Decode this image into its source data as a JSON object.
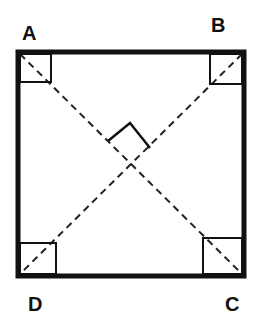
{
  "diagram": {
    "vertices": {
      "A": {
        "label": "A",
        "position": "top-left"
      },
      "B": {
        "label": "B",
        "position": "top-right"
      },
      "C": {
        "label": "C",
        "position": "bottom-right"
      },
      "D": {
        "label": "D",
        "position": "bottom-left"
      }
    },
    "diagonals": [
      "AC",
      "BD"
    ],
    "right_angle_markers": [
      "A",
      "B",
      "C",
      "D",
      "intersection"
    ],
    "colors": {
      "stroke": "#111111",
      "background": "#ffffff"
    }
  }
}
